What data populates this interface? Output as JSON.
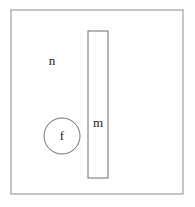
{
  "figure": {
    "background_color": "#ffffff",
    "width": 195,
    "height": 207
  },
  "frame": {
    "name": "outer-boundary",
    "shape": "rectangle",
    "x": 11,
    "y": 10,
    "width": 172,
    "height": 184,
    "stroke_color": "#8c8c8c",
    "stroke_width": 1,
    "fill": "none"
  },
  "bar": {
    "name": "vertical-bar",
    "shape": "rectangle",
    "x": 88,
    "y": 31,
    "width": 20,
    "height": 147,
    "stroke_color": "#6e6e6e",
    "stroke_width": 1,
    "fill": "none"
  },
  "circle": {
    "name": "circle-body",
    "shape": "circle",
    "cx": 62,
    "cy": 136,
    "r": 18,
    "stroke_color": "#6e6e6e",
    "stroke_width": 1,
    "fill": "none"
  },
  "labels": [
    {
      "id": "label-n",
      "text": "n",
      "x": 52,
      "y": 62,
      "font_size": 13,
      "color": "#1a1a1a",
      "describes": "outer-boundary"
    },
    {
      "id": "label-m",
      "text": "m",
      "x": 98,
      "y": 124,
      "font_size": 13,
      "color": "#1a1a1a",
      "describes": "vertical-bar"
    },
    {
      "id": "label-f",
      "text": "f",
      "x": 62,
      "y": 137,
      "font_size": 13,
      "color": "#1a1a1a",
      "describes": "circle-body"
    }
  ]
}
